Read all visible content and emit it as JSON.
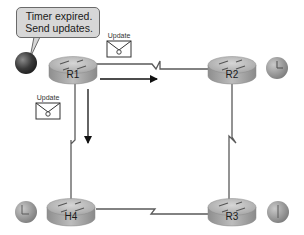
{
  "diagram": {
    "callout": {
      "line1": "Timer expired.",
      "line2": "Send updates."
    },
    "routers": [
      {
        "id": "R1",
        "label": "R1",
        "timer_state": "expired"
      },
      {
        "id": "R2",
        "label": "R2",
        "timer_state": "running"
      },
      {
        "id": "R3",
        "label": "R3",
        "timer_state": "running"
      },
      {
        "id": "H4",
        "label": "H4",
        "timer_state": "running"
      }
    ],
    "links": [
      {
        "from": "R1",
        "to": "R2",
        "type": "serial"
      },
      {
        "from": "R2",
        "to": "R3",
        "type": "serial"
      },
      {
        "from": "R3",
        "to": "H4",
        "type": "serial"
      },
      {
        "from": "H4",
        "to": "R1",
        "type": "serial"
      }
    ],
    "messages": [
      {
        "label": "Update",
        "from": "R1",
        "to": "R2",
        "direction": "right"
      },
      {
        "label": "Update",
        "from": "R1",
        "to": "H4",
        "direction": "down"
      }
    ],
    "colors": {
      "router_body": "#a9a9a9",
      "router_top": "#c8c8c8",
      "link": "#555555",
      "callout_bg": "#d7d7d7",
      "timer_expired": "#3c3c3c",
      "timer_running": "#9a9a9a"
    }
  }
}
